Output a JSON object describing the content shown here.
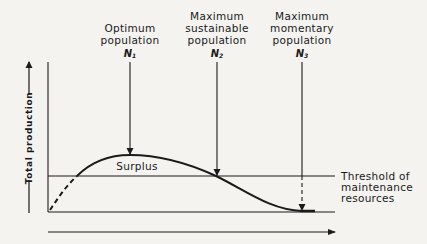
{
  "diagram": {
    "y_axis_label": "Total production",
    "markers": [
      {
        "id": "n1",
        "label_lines": [
          "Optimum",
          "population"
        ],
        "symbol": "N",
        "subscript": "1"
      },
      {
        "id": "n2",
        "label_lines": [
          "Maximum",
          "sustainable",
          "population"
        ],
        "symbol": "N",
        "subscript": "2"
      },
      {
        "id": "n3",
        "label_lines": [
          "Maximum",
          "momentary",
          "population"
        ],
        "symbol": "N",
        "subscript": "3"
      }
    ],
    "curve_region_label": "Surplus",
    "threshold_label_lines": [
      "Threshold of",
      "maintenance",
      "resources"
    ],
    "colors": {
      "ink": "#1a1a1a",
      "paper": "#f4f3f0"
    }
  }
}
